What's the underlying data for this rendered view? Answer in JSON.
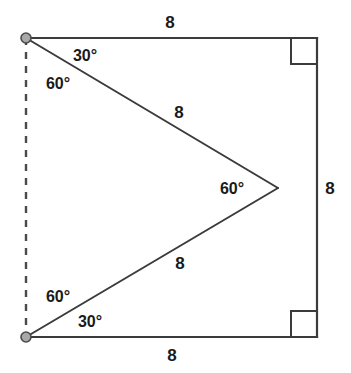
{
  "figure": {
    "width": 351,
    "height": 373,
    "background": "#ffffff",
    "stroke_color": "#3b3b3b",
    "vertex_fill": "#a8a8a8",
    "vertex_stroke": "#4a4a4a",
    "text_color": "#1a1a1a"
  },
  "points": {
    "top_left": {
      "x": 26,
      "y": 38,
      "marker": "filled-circle"
    },
    "bottom_left": {
      "x": 26,
      "y": 337,
      "marker": "filled-circle"
    },
    "top_right": {
      "x": 317,
      "y": 39,
      "marker": "right-angle"
    },
    "bottom_right": {
      "x": 317,
      "y": 337,
      "marker": "right-angle"
    },
    "apex": {
      "x": 278,
      "y": 188,
      "marker": "none"
    }
  },
  "segments": [
    {
      "name": "top-side",
      "from": "top_left",
      "to": "top_right",
      "style": "solid"
    },
    {
      "name": "right-side",
      "from": "top_right",
      "to": "bottom_right",
      "style": "solid"
    },
    {
      "name": "bottom-side",
      "from": "bottom_left",
      "to": "bottom_right",
      "style": "solid"
    },
    {
      "name": "left-side",
      "from": "top_left",
      "to": "bottom_left",
      "style": "dashed"
    },
    {
      "name": "upper-diagonal",
      "from": "top_left",
      "to": "apex",
      "style": "solid"
    },
    {
      "name": "lower-diagonal",
      "from": "apex",
      "to": "bottom_left",
      "style": "solid"
    }
  ],
  "labels": {
    "top_side_length": {
      "text": "8",
      "x": 170,
      "y": 22
    },
    "right_side_length": {
      "text": "8",
      "x": 330,
      "y": 188
    },
    "bottom_side_length": {
      "text": "8",
      "x": 172,
      "y": 355
    },
    "upper_diagonal_length": {
      "text": "8",
      "x": 179,
      "y": 112
    },
    "lower_diagonal_length": {
      "text": "8",
      "x": 180,
      "y": 263
    },
    "angle_top_30": {
      "text": "30°",
      "x": 85,
      "y": 56
    },
    "angle_top_60": {
      "text": "60°",
      "x": 58,
      "y": 84
    },
    "angle_apex_60": {
      "text": "60°",
      "x": 232,
      "y": 189
    },
    "angle_bottom_60": {
      "text": "60°",
      "x": 58,
      "y": 297
    },
    "angle_bottom_30": {
      "text": "30°",
      "x": 90,
      "y": 322
    }
  },
  "right_angle_markers": {
    "size": 26,
    "top_right_label": "right angle at top right corner",
    "bottom_right_label": "right angle at bottom right corner"
  }
}
